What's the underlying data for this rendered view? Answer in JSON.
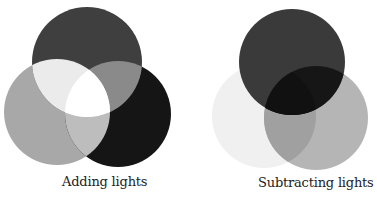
{
  "figures": [
    {
      "caption": "Adding lights",
      "circles": [
        {
          "name": "top",
          "cx": 87,
          "cy": 62,
          "r": 55,
          "color": "#3f3f3f"
        },
        {
          "name": "left",
          "cx": 57,
          "cy": 112,
          "r": 53,
          "color": "#a8a8a8"
        },
        {
          "name": "right",
          "cx": 118,
          "cy": 114,
          "r": 53,
          "color": "#151515"
        }
      ],
      "overlaps": {
        "top_left": "#ebebeb",
        "top_right": "#8a8a8a",
        "left_right": "#bdbdbd",
        "center": "#ffffff"
      }
    },
    {
      "caption": "Subtracting lights",
      "circles": [
        {
          "name": "top",
          "cx": 292,
          "cy": 62,
          "r": 53,
          "color": "#3a3a3a"
        },
        {
          "name": "left",
          "cx": 264,
          "cy": 116,
          "r": 52,
          "color": "#f0f0f0"
        },
        {
          "name": "right",
          "cx": 316,
          "cy": 118,
          "r": 52,
          "color": "#b5b5b5"
        }
      ],
      "overlaps": {
        "top_left": "#3a3a3a",
        "top_right": "#151515",
        "left_right": "#a0a0a0",
        "center": "#111111"
      }
    }
  ]
}
